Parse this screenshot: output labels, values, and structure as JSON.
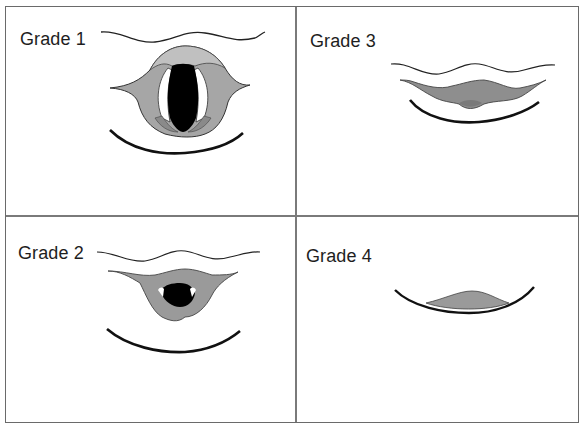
{
  "figure": {
    "panels": [
      {
        "label": "Grade 1",
        "description": "Full view of glottis"
      },
      {
        "label": "Grade 2",
        "description": "Partial view of glottis"
      },
      {
        "label": "Grade 3",
        "description": "Only epiglottis visible"
      },
      {
        "label": "Grade 4",
        "description": "Neither glottis nor epiglottis visible"
      }
    ]
  },
  "colors": {
    "border": "#6a6a6a",
    "tissue_fill": "#9a9a9a",
    "epiglottis_fill": "#b4b4b4",
    "glottis_fill": "#000000",
    "outline": "#222222"
  }
}
